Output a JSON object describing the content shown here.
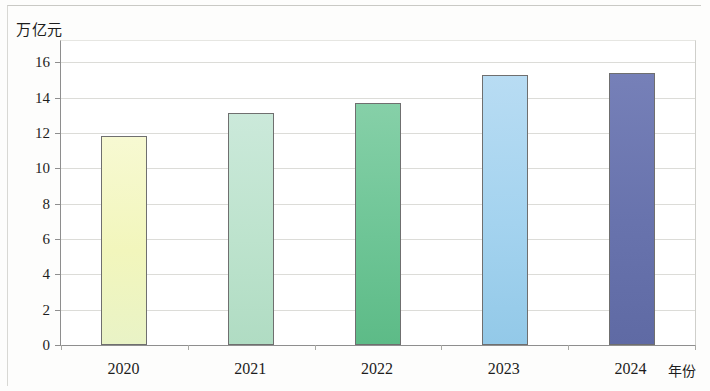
{
  "chart_data": {
    "type": "bar",
    "title": "",
    "subtitle": "",
    "xlabel": "年份",
    "ylabel": "万亿元",
    "categories": [
      "2020",
      "2021",
      "2022",
      "2023",
      "2024"
    ],
    "values": [
      11.8,
      13.1,
      13.7,
      15.3,
      15.4
    ],
    "series": [
      {
        "name": "",
        "values": [
          11.8,
          13.1,
          13.7,
          15.3,
          15.4
        ]
      }
    ],
    "ylim": [
      0,
      17.2
    ],
    "y_ticks": [
      "0",
      "2",
      "4",
      "6",
      "8",
      "10",
      "12",
      "14",
      "16"
    ],
    "y_tick_values": [
      0,
      2,
      4,
      6,
      8,
      10,
      12,
      14,
      16
    ],
    "grid": true,
    "legend": "none",
    "bar_colors": [
      "#f2f6bc",
      "#bde3cd",
      "#6ec596",
      "#a4d3ef",
      "#6873ad"
    ],
    "bar_color_tops": [
      "#f7f9d2",
      "#cbe9da",
      "#86d0a8",
      "#b8dcf3",
      "#7680b8"
    ],
    "bar_color_bottoms": [
      "#e9f3c6",
      "#b0dcc3",
      "#5dbb87",
      "#93c9e8",
      "#5f6aa4"
    ],
    "bar_border_color": "#6f6f6f",
    "axis_color": "#8e8e8e",
    "grid_color": "#dcdcd8"
  }
}
